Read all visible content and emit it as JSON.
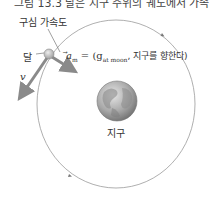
{
  "caption_partial": "그림 13.3 달은 지구 주위의 궤도에서 가속된다",
  "labels": {
    "centripetal_acceleration": "구심 가속도",
    "moon": "달",
    "acceleration_symbol": "a",
    "acceleration_subscript": "m",
    "acceleration_equals": " = (g",
    "acceleration_gsub": "at moon",
    "acceleration_rest": ", 지구를 향한다)",
    "velocity_symbol": "v",
    "earth": "지구"
  },
  "colors": {
    "orbit": "#9a9a9a",
    "arrow": "#8a8a8a",
    "earth_base": "#9c9c9c",
    "moon": "#b8b8b8",
    "text": "#333333"
  }
}
